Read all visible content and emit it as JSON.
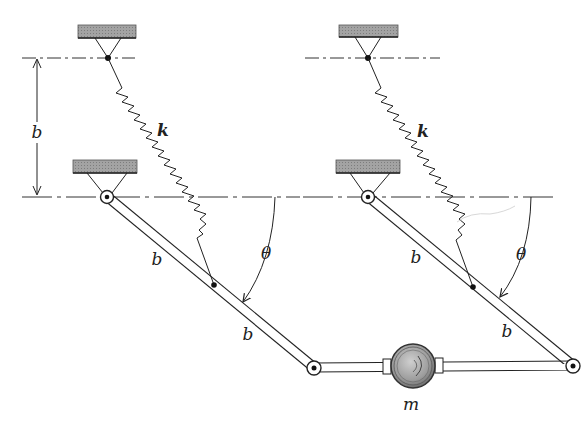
{
  "colors": {
    "ink": "#222222",
    "ground": "#9a9a9a",
    "mass": "#a8a8a8",
    "background": "#ffffff"
  },
  "labels": {
    "dimension_b": "b",
    "left_spring_k": "k",
    "right_spring_k": "k",
    "left_link_upper_b": "b",
    "left_link_lower_b": "b",
    "right_link_upper_b": "b",
    "right_link_lower_b": "b",
    "left_theta": "θ",
    "right_theta": "θ",
    "mass_m": "m"
  },
  "geometry": {
    "left": {
      "top_support": {
        "x": 78,
        "y": 25,
        "w": 58,
        "h": 13,
        "pivot": [
          108,
          58
        ]
      },
      "bottom_support": {
        "x": 73,
        "y": 160,
        "w": 64,
        "h": 13,
        "pivot": [
          107,
          197
        ]
      },
      "spring": {
        "start": [
          108,
          58
        ],
        "coil_start": [
          122,
          88
        ],
        "coil_end": [
          197,
          238
        ],
        "end": [
          214,
          285
        ],
        "coils": 17
      },
      "link_end": [
        314,
        368
      ],
      "theta_arc": {
        "start": [
          275,
          197
        ],
        "end": [
          243,
          302
        ]
      }
    },
    "right": {
      "top_support": {
        "x": 339,
        "y": 25,
        "w": 59,
        "h": 12,
        "pivot": [
          368,
          58
        ]
      },
      "bottom_support": {
        "x": 336,
        "y": 160,
        "w": 64,
        "h": 13,
        "pivot": [
          368,
          197
        ]
      },
      "spring": {
        "start": [
          368,
          58
        ],
        "coil_start": [
          381,
          88
        ],
        "coil_end": [
          456,
          240
        ],
        "end": [
          473,
          287
        ],
        "coils": 17
      },
      "link_end": [
        573,
        366
      ],
      "theta_arc": {
        "start": [
          531,
          197
        ],
        "end": [
          500,
          297
        ]
      }
    },
    "mass": {
      "cx": 413,
      "cy": 366,
      "r": 22
    },
    "dimension": {
      "x": 37,
      "y1": 58,
      "y2": 196
    }
  }
}
